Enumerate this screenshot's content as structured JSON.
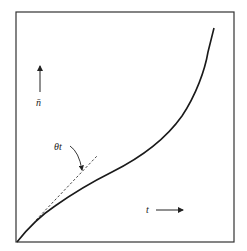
{
  "figure": {
    "type": "line diagram",
    "y_axis_label": "n̄",
    "x_axis_label": "t",
    "annotation": "θt",
    "curves": [
      {
        "name": "n-bar vs t",
        "style": "solid",
        "shape": "concave then convex, rising steeply at right",
        "points": [
          [
            0,
            0
          ],
          [
            0.1,
            0.11
          ],
          [
            0.2,
            0.18
          ],
          [
            0.3,
            0.25
          ],
          [
            0.39,
            0.29
          ],
          [
            0.48,
            0.34
          ],
          [
            0.57,
            0.39
          ],
          [
            0.66,
            0.44
          ],
          [
            0.73,
            0.51
          ],
          [
            0.8,
            0.6
          ],
          [
            0.84,
            0.68
          ],
          [
            0.88,
            0.79
          ],
          [
            0.9,
            0.88
          ],
          [
            0.91,
            0.93
          ]
        ]
      },
      {
        "name": "initial slope θt",
        "style": "dashed",
        "shape": "straight tangent line at origin"
      }
    ],
    "colors": {
      "line": "#1a1a1a",
      "frame": "#333333",
      "background": "#ffffff"
    }
  }
}
